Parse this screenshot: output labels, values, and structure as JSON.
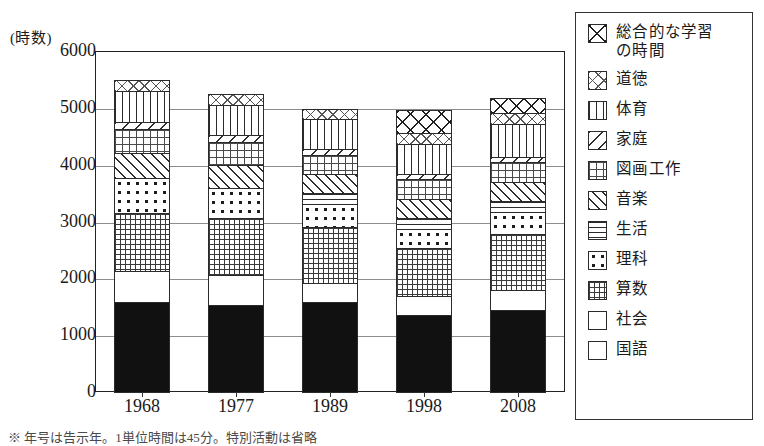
{
  "chart_data": {
    "type": "bar",
    "subtype": "stacked-bar",
    "title": "",
    "xlabel": "",
    "ylabel": "(時数)",
    "ylim": [
      0,
      6000
    ],
    "ytick_labels": [
      "0",
      "1000",
      "2000",
      "3000",
      "4000",
      "5000",
      "6000"
    ],
    "ytick_values": [
      0,
      1000,
      2000,
      3000,
      4000,
      5000,
      6000
    ],
    "grid": true,
    "legend_position": "right",
    "categories": [
      "1968",
      "1977",
      "1989",
      "1998",
      "2008"
    ],
    "series": [
      {
        "name": "国語",
        "values": [
          1603,
          1543,
          1601,
          1377,
          1461
        ]
      },
      {
        "name": "社会",
        "values": [
          558,
          555,
          345,
          345,
          365
        ]
      },
      {
        "name": "算数",
        "values": [
          1047,
          1010,
          1011,
          869,
          1011
        ]
      },
      {
        "name": "理科",
        "values": [
          628,
          558,
          420,
          350,
          405
        ]
      },
      {
        "name": "生活",
        "values": [
          0,
          0,
          207,
          207,
          207
        ]
      },
      {
        "name": "音楽",
        "values": [
          452,
          418,
          358,
          358,
          358
        ]
      },
      {
        "name": "図画工作",
        "values": [
          452,
          418,
          358,
          358,
          358
        ]
      },
      {
        "name": "家庭",
        "values": [
          140,
          140,
          115,
          115,
          115
        ]
      },
      {
        "name": "体育",
        "values": [
          558,
          558,
          540,
          540,
          597
        ]
      },
      {
        "name": "道徳",
        "values": [
          209,
          209,
          209,
          209,
          209
        ]
      },
      {
        "name": "総合的な学習の時間",
        "values": [
          0,
          0,
          0,
          430,
          280
        ]
      }
    ],
    "totals": [
      5647,
      5409,
      5164,
      5158,
      5366
    ]
  },
  "axis": {
    "unit_label": "(時数)"
  },
  "legend": {
    "items": [
      {
        "label": "総合的な学習\nの時間",
        "pattern": "p-sogo",
        "icon": "crosshatch-x-swatch"
      },
      {
        "label": "道徳",
        "pattern": "p-doutoku",
        "icon": "fine-crosshatch-swatch"
      },
      {
        "label": "体育",
        "pattern": "p-taiiku",
        "icon": "vertical-lines-swatch"
      },
      {
        "label": "家庭",
        "pattern": "p-katei",
        "icon": "diagonal-lines-swatch"
      },
      {
        "label": "図画工作",
        "pattern": "p-zuga",
        "icon": "fine-grid-swatch"
      },
      {
        "label": "音楽",
        "pattern": "p-ongaku",
        "icon": "dense-diagonal-swatch"
      },
      {
        "label": "生活",
        "pattern": "p-seikatsu",
        "icon": "horizontal-lines-swatch"
      },
      {
        "label": "理科",
        "pattern": "p-rika",
        "icon": "dots-swatch"
      },
      {
        "label": "算数",
        "pattern": "p-sansu",
        "icon": "grid-swatch"
      },
      {
        "label": "社会",
        "pattern": "p-shakai",
        "icon": "blank-swatch"
      },
      {
        "label": "国語",
        "pattern": "p-kokugo",
        "icon": "solid-black-swatch"
      }
    ]
  },
  "footnote": {
    "text": "※ 年号は告示年。1単位時間は45分。特別活動は省略"
  }
}
